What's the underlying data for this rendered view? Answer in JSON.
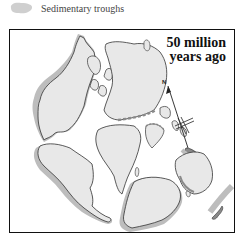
{
  "legend": {
    "swatch_color": "#cfcfcf",
    "label": "Sedimentary troughs"
  },
  "map": {
    "title_line1": "50 million",
    "title_line2": "years ago",
    "compass_label": "N",
    "colors": {
      "land": "#e8e8e8",
      "land_outline": "#333333",
      "trough": "#bdbdbd",
      "trough_dark": "#8a8a8a",
      "frame": "#111111"
    }
  }
}
